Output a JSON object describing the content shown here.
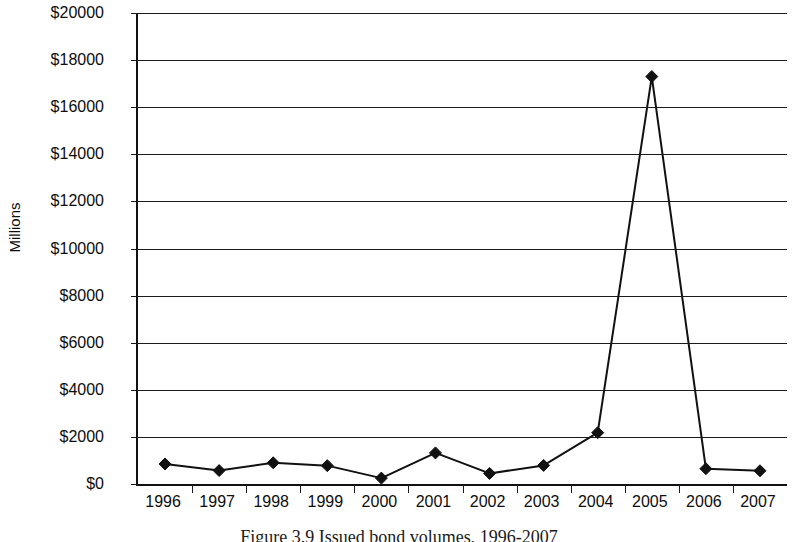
{
  "chart_data": {
    "type": "line",
    "title": "",
    "xlabel": "",
    "ylabel": "Millions",
    "categories": [
      "1996",
      "1997",
      "1998",
      "1999",
      "2000",
      "2001",
      "2002",
      "2003",
      "2004",
      "2005",
      "2006",
      "2007"
    ],
    "values": [
      850,
      570,
      900,
      780,
      250,
      1320,
      450,
      790,
      2180,
      17300,
      650,
      560
    ],
    "series": [
      {
        "name": "Issued volume",
        "values": [
          850,
          570,
          900,
          780,
          250,
          1320,
          450,
          790,
          2180,
          17300,
          650,
          560
        ]
      }
    ],
    "ylim": [
      0,
      20000
    ],
    "y_tick_step": 2000,
    "y_tick_labels": [
      "$20000",
      "$18000",
      "$16000",
      "$14000",
      "$12000",
      "$10000",
      "$8000",
      "$6000",
      "$4000",
      "$2000",
      "$0"
    ],
    "y_tick_values": [
      20000,
      18000,
      16000,
      14000,
      12000,
      10000,
      8000,
      6000,
      4000,
      2000,
      0
    ],
    "grid": true,
    "grid_axis": "y",
    "legend": false,
    "legend_position": "none",
    "marker": "diamond",
    "marker_color": "#111111",
    "line_color": "#111111",
    "plot_background": "#ffffff",
    "axis_color": "#111111"
  },
  "axes": {
    "y_title": "Millions"
  },
  "caption": {
    "text": "Figure 3.9 Issued bond volumes, 1996-2007"
  }
}
